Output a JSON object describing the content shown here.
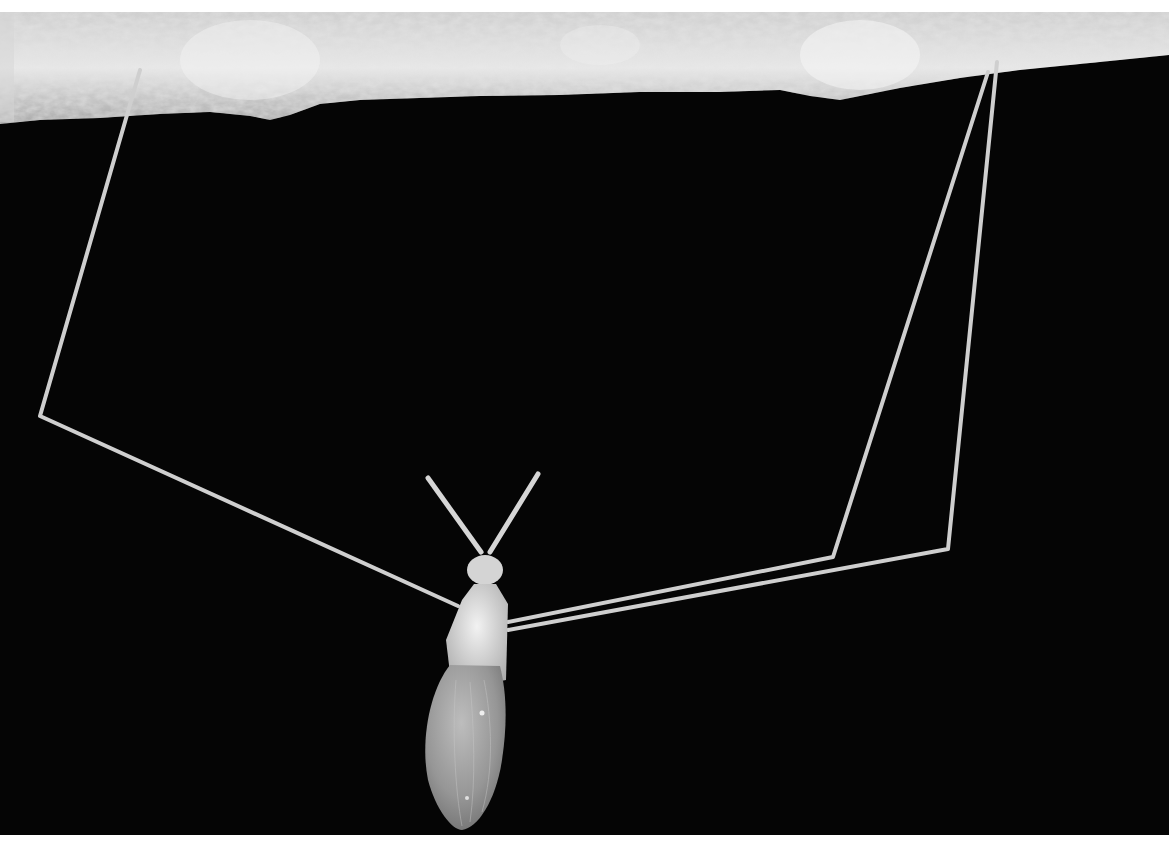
{
  "image": {
    "alt": "Black and white photograph of a long-legged insect hanging beneath a textured branch against a black background",
    "subject": "long-legged insect suspended by thin legs from underside of bark branch",
    "colors": {
      "background": "#050505",
      "bark_light": "#e6e6e6",
      "bark_mid": "#b4b4b4",
      "bark_dark": "#7d7d7d",
      "leg": "#cfcfcf",
      "body": "#d9d9d9",
      "wing": "#9a9a9a",
      "border": "#ffffff"
    }
  }
}
